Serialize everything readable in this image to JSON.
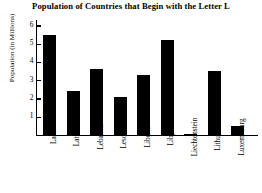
{
  "chart_data": {
    "type": "bar",
    "title": "Population of Countries that Begin with the Letter L",
    "xlabel": "",
    "ylabel": "Population (in Millions)",
    "categories": [
      "Laos",
      "Latvia",
      "Lebanon",
      "Lesotho",
      "Liberia",
      "Libya",
      "Liechtenstein",
      "Lithuania",
      "Luxembourg"
    ],
    "values": [
      5.5,
      2.4,
      3.6,
      2.1,
      3.3,
      5.2,
      0.05,
      3.5,
      0.5
    ],
    "ylim": [
      0,
      6.3
    ],
    "yticks": [
      1,
      2,
      3,
      4,
      5,
      6
    ],
    "ytick_labels": [
      "1",
      "2",
      "3",
      "4",
      "5",
      "6"
    ],
    "grid": false,
    "legend": false,
    "bar_color": "#000000",
    "axis_color": "#000000",
    "background": "#ffffff"
  }
}
